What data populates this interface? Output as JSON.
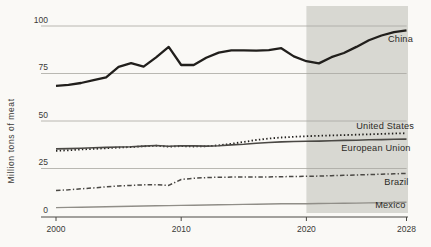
{
  "colors": {
    "background": "#faf9f6",
    "forecast_shade": "#d8d8d2",
    "gridline": "#a8a7a1",
    "axis": "#4a4945",
    "tick_text": "#3b3a36",
    "label_text": "#2b2a26"
  },
  "chart_data": {
    "type": "line",
    "title": "",
    "xlabel": "",
    "ylabel": "Million tons of meat",
    "xlim": [
      2000,
      2028
    ],
    "ylim": [
      0,
      100
    ],
    "x_ticks": [
      2000,
      2010,
      2020,
      2028
    ],
    "y_ticks": [
      0,
      25,
      50,
      75,
      100
    ],
    "grid": "horizontal",
    "legend_position": "end-of-line-labels",
    "forecast_region": {
      "start": 2020,
      "end": 2028
    },
    "x": [
      2000,
      2001,
      2002,
      2003,
      2004,
      2005,
      2006,
      2007,
      2008,
      2009,
      2010,
      2011,
      2012,
      2013,
      2014,
      2015,
      2016,
      2017,
      2018,
      2019,
      2020,
      2021,
      2022,
      2023,
      2024,
      2025,
      2026,
      2027,
      2028
    ],
    "series": [
      {
        "name": "China",
        "style": "solid",
        "color": "#211f1c",
        "width": 2.3,
        "label_x": 413,
        "label_y": 42,
        "values": [
          68.5,
          69,
          70,
          71.5,
          73,
          78.5,
          80.4,
          78.6,
          83.5,
          89,
          79.5,
          79.5,
          83.3,
          86,
          87.2,
          87.2,
          87,
          87.3,
          88.3,
          84,
          81.5,
          80.3,
          83.6,
          85.8,
          89,
          92.5,
          95,
          96.8,
          97.7
        ]
      },
      {
        "name": "United States",
        "style": "dotted",
        "color": "#211f1c",
        "width": 1.8,
        "label_x": 414,
        "label_y": 128.5,
        "values": [
          34.3,
          34.6,
          35,
          35.3,
          35.7,
          36,
          36.3,
          36.7,
          37,
          36.5,
          36.8,
          36.6,
          36.7,
          37.2,
          38,
          39,
          40,
          40.8,
          41.3,
          41.7,
          42,
          42.2,
          42.4,
          42.6,
          42.8,
          43,
          43.2,
          43.4,
          43.6
        ]
      },
      {
        "name": "European Union",
        "style": "solid",
        "color": "#4a4844",
        "width": 1.6,
        "label_x": 410.5,
        "label_y": 150.5,
        "values": [
          35.3,
          35.5,
          35.7,
          35.9,
          36.1,
          36.3,
          36.5,
          36.8,
          37.1,
          36.7,
          37,
          36.9,
          36.8,
          37,
          37.4,
          37.8,
          38.3,
          38.7,
          39,
          39.2,
          39.3,
          39.4,
          39.6,
          39.8,
          39.9,
          40.1,
          40.2,
          40.4,
          40.5
        ]
      },
      {
        "name": "Brazil",
        "style": "dashdot",
        "color": "#4a4844",
        "width": 1.5,
        "label_x": 408.5,
        "label_y": 185,
        "values": [
          13.4,
          13.8,
          14.3,
          14.8,
          15.3,
          15.8,
          16.1,
          16.4,
          16.5,
          16.1,
          19.2,
          19.9,
          20.2,
          20.4,
          20.5,
          20.5,
          20.6,
          20.6,
          20.7,
          20.8,
          20.9,
          21,
          21.2,
          21.4,
          21.6,
          21.8,
          22,
          22.2,
          22.4
        ]
      },
      {
        "name": "Mexico",
        "style": "solid",
        "color": "#908e88",
        "width": 1.4,
        "label_x": 405.5,
        "label_y": 208,
        "values": [
          4.4,
          4.5,
          4.6,
          4.75,
          4.9,
          5,
          5.1,
          5.25,
          5.4,
          5.5,
          5.6,
          5.7,
          5.8,
          5.9,
          6,
          6.1,
          6.2,
          6.3,
          6.4,
          6.45,
          6.5,
          6.6,
          6.65,
          6.7,
          6.8,
          6.9,
          7,
          7.1,
          7.2
        ]
      }
    ]
  }
}
